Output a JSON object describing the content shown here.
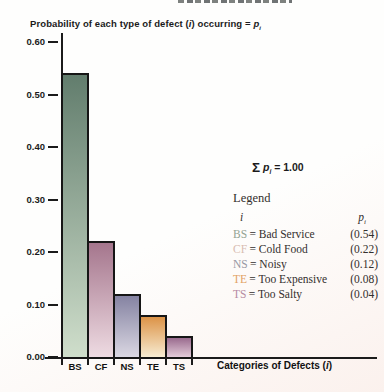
{
  "title_parts": {
    "before": "Probability of each type of defect (",
    "i": "i",
    "after": ") occurring = ",
    "p": "p",
    "p_sub": "i"
  },
  "xlabel_parts": {
    "before": "Categories of Defects (",
    "i": "i",
    "after": ")"
  },
  "annotation_parts": {
    "sigma": "Σ",
    "p": "p",
    "p_sub": "i",
    "rest": "= 1.00"
  },
  "legend": {
    "heading": "Legend",
    "col_i": "i",
    "col_p": "p",
    "col_p_sub": "i",
    "separator": "=",
    "entries": [
      {
        "code": "BS",
        "name": "Bad Service",
        "value": "(0.54)",
        "color": "#93a393"
      },
      {
        "code": "CF",
        "name": "Cold Food",
        "value": "(0.22)",
        "color": "#d9bcb1"
      },
      {
        "code": "NS",
        "name": "Noisy",
        "value": "(0.12)",
        "color": "#9798a4"
      },
      {
        "code": "TE",
        "name": "Too Expensive",
        "value": "(0.08)",
        "color": "#e2a366"
      },
      {
        "code": "TS",
        "name": "Too Salty",
        "value": "(0.04)",
        "color": "#b78ca3"
      }
    ]
  },
  "chart_data": {
    "type": "bar",
    "title": "Probability of each type of defect (i) occurring = pi",
    "xlabel": "Categories of Defects (i)",
    "ylabel": "",
    "categories": [
      "BS",
      "CF",
      "NS",
      "TE",
      "TS"
    ],
    "values": [
      0.54,
      0.22,
      0.12,
      0.08,
      0.04
    ],
    "ylim": [
      0,
      0.6
    ],
    "ytick_values": [
      0.6,
      0.5,
      0.4,
      0.3,
      0.2,
      0.1,
      0.0
    ],
    "ytick_labels": [
      "0.60",
      "0.50",
      "0.40",
      "0.30",
      "0.20",
      "0.10",
      "0.00"
    ],
    "annotation": "Σ pi = 1.00",
    "grid": false,
    "legend_position": "right",
    "legend_entries": [
      {
        "code": "BS",
        "label": "Bad Service",
        "p": 0.54
      },
      {
        "code": "CF",
        "label": "Cold Food",
        "p": 0.22
      },
      {
        "code": "NS",
        "label": "Noisy",
        "p": 0.12
      },
      {
        "code": "TE",
        "label": "Too Expensive",
        "p": 0.08
      },
      {
        "code": "TS",
        "label": "Too Salty",
        "p": 0.04
      }
    ],
    "bar_gradients": [
      {
        "top": "#627d6d",
        "bottom": "#cfdecb"
      },
      {
        "top": "#a5768d",
        "bottom": "#eedbe2"
      },
      {
        "top": "#8583a2",
        "bottom": "#dad7e2"
      },
      {
        "top": "#dc9347",
        "bottom": "#f7ecd2"
      },
      {
        "top": "#9a6b8e",
        "bottom": "#e3cbd9"
      }
    ]
  }
}
